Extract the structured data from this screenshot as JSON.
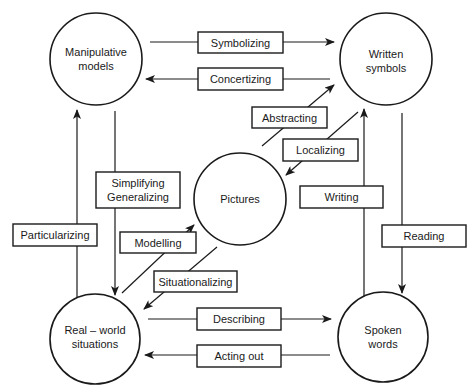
{
  "diagram": {
    "colors": {
      "stroke": "#1a1a1a",
      "background": "#ffffff"
    },
    "nodes": {
      "manipulative_models": {
        "line1": "Manipulative",
        "line2": "models"
      },
      "written_symbols": {
        "line1": "Written",
        "line2": "symbols"
      },
      "pictures": {
        "line1": "Pictures"
      },
      "real_world_situations": {
        "line1": "Real – world",
        "line2": "situations"
      },
      "spoken_words": {
        "line1": "Spoken",
        "line2": "words"
      }
    },
    "edges": {
      "symbolizing": {
        "label": "Symbolizing",
        "from": "Manipulative models",
        "to": "Written symbols"
      },
      "concertizing": {
        "label": "Concertizing",
        "from": "Written symbols",
        "to": "Manipulative models"
      },
      "abstracting": {
        "label": "Abstracting",
        "from": "Pictures",
        "to": "Written symbols"
      },
      "localizing": {
        "label": "Localizing",
        "from": "Written symbols",
        "to": "Pictures"
      },
      "simplifying_generalizing": {
        "line1": "Simplifying",
        "line2": "Generalizing",
        "from": "Manipulative models",
        "to": "Real – world situations"
      },
      "particularizing": {
        "label": "Particularizing",
        "from": "Real – world situations",
        "to": "Manipulative models"
      },
      "modelling": {
        "label": "Modelling",
        "from": "Real – world situations",
        "to": "Pictures"
      },
      "situationalizing": {
        "label": "Situationalizing",
        "from": "Pictures",
        "to": "Real – world situations"
      },
      "writing": {
        "label": "Writing",
        "from": "Spoken words",
        "to": "Written symbols"
      },
      "reading": {
        "label": "Reading",
        "from": "Written symbols",
        "to": "Spoken words"
      },
      "describing": {
        "label": "Describing",
        "from": "Real – world situations",
        "to": "Spoken words"
      },
      "acting_out": {
        "label": "Acting out",
        "from": "Spoken words",
        "to": "Real – world situations"
      }
    }
  }
}
